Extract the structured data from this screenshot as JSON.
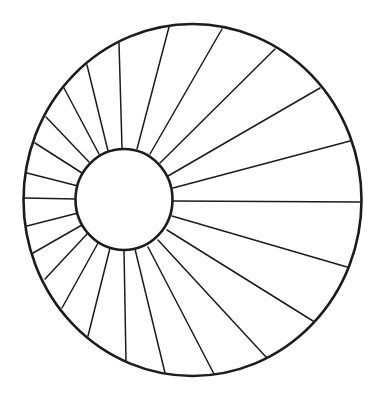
{
  "diagram": {
    "type": "radial-spoke-wheel",
    "colors": {
      "background": "#ffffff",
      "stroke": "#1c1c1c"
    },
    "outer_circle": {
      "cx": 192.5,
      "cy": 200,
      "rx": 169,
      "ry": 176
    },
    "inner_circle": {
      "cx": 124,
      "cy": 199.5,
      "rx": 48.5,
      "ry": 50.5
    },
    "spoke_count": 24,
    "spokes": [
      {
        "x1": 173,
        "y1": 201,
        "x2": 361,
        "y2": 202
      },
      {
        "x1": 172,
        "y1": 216,
        "x2": 347,
        "y2": 267
      },
      {
        "x1": 167,
        "y1": 230,
        "x2": 313,
        "y2": 321
      },
      {
        "x1": 158,
        "y1": 240,
        "x2": 266,
        "y2": 357
      },
      {
        "x1": 148,
        "y1": 247,
        "x2": 214,
        "y2": 374
      },
      {
        "x1": 135,
        "y1": 249,
        "x2": 165,
        "y2": 373
      },
      {
        "x1": 124,
        "y1": 250,
        "x2": 126,
        "y2": 361
      },
      {
        "x1": 110,
        "y1": 248,
        "x2": 88,
        "y2": 336
      },
      {
        "x1": 98,
        "y1": 243,
        "x2": 62,
        "y2": 308
      },
      {
        "x1": 88,
        "y1": 233,
        "x2": 45,
        "y2": 279
      },
      {
        "x1": 82,
        "y1": 225,
        "x2": 33,
        "y2": 253
      },
      {
        "x1": 78,
        "y1": 213,
        "x2": 27,
        "y2": 226
      },
      {
        "x1": 76,
        "y1": 199,
        "x2": 24,
        "y2": 198
      },
      {
        "x1": 78,
        "y1": 186,
        "x2": 27,
        "y2": 173
      },
      {
        "x1": 82,
        "y1": 173,
        "x2": 35,
        "y2": 143
      },
      {
        "x1": 89,
        "y1": 162,
        "x2": 46,
        "y2": 117
      },
      {
        "x1": 99,
        "y1": 154,
        "x2": 64,
        "y2": 88
      },
      {
        "x1": 108,
        "y1": 151,
        "x2": 87,
        "y2": 65
      },
      {
        "x1": 122,
        "y1": 148,
        "x2": 119,
        "y2": 43
      },
      {
        "x1": 137,
        "y1": 149,
        "x2": 169,
        "y2": 27
      },
      {
        "x1": 150,
        "y1": 154,
        "x2": 222,
        "y2": 29
      },
      {
        "x1": 160,
        "y1": 163,
        "x2": 275,
        "y2": 49
      },
      {
        "x1": 168,
        "y1": 176,
        "x2": 320,
        "y2": 88
      },
      {
        "x1": 173,
        "y1": 188,
        "x2": 350,
        "y2": 141
      }
    ]
  }
}
